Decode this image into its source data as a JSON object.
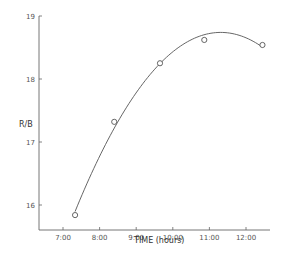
{
  "chart_data": {
    "type": "line",
    "title": "",
    "xlabel": "TIME (hours)",
    "ylabel": "R/B",
    "x_tick_labels": [
      "7:00",
      "8:00",
      "9:00",
      "10:00",
      "11:00",
      "12:00"
    ],
    "x_ticks": [
      7,
      8,
      9,
      10,
      11,
      12
    ],
    "y_tick_labels": [
      "16",
      "17",
      "18",
      "19"
    ],
    "y_ticks": [
      16,
      17,
      18,
      19
    ],
    "xlim": [
      6.35,
      12.9
    ],
    "ylim": [
      15.6,
      19
    ],
    "grid": false,
    "legend": null,
    "series": [
      {
        "name": "R/B",
        "marker": "open-circle",
        "line": "smooth-fit",
        "x": [
          7.33,
          8.4,
          9.65,
          10.86,
          12.45
        ],
        "values": [
          15.84,
          17.32,
          18.25,
          18.62,
          18.54
        ]
      }
    ],
    "fit_curve_peak": {
      "x": 11.5,
      "y": 18.67
    }
  },
  "labels": {
    "xlabel": "TIME (hours)",
    "ylabel": "R/B"
  },
  "colors": {
    "line": "#555555",
    "axis": "#666666",
    "text": "#444444"
  }
}
